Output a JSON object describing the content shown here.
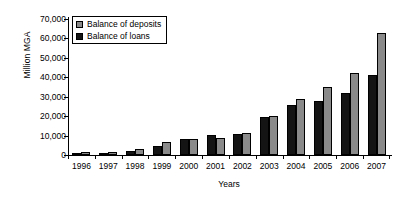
{
  "chart_data": {
    "type": "bar",
    "title": "",
    "xlabel": "Years",
    "ylabel": "Million MGA",
    "categories": [
      "1996",
      "1997",
      "1998",
      "1999",
      "2000",
      "2001",
      "2002",
      "2003",
      "2004",
      "2005",
      "2006",
      "2007"
    ],
    "series": [
      {
        "name": "Balance of loans",
        "color": "#141414",
        "values": [
          1000,
          1200,
          2000,
          4500,
          8000,
          10500,
          11000,
          19500,
          26000,
          28000,
          32000,
          41000
        ]
      },
      {
        "name": "Balance of deposits",
        "color": "#8a8a8a",
        "values": [
          1500,
          1500,
          3000,
          6500,
          8500,
          9000,
          11500,
          20000,
          29000,
          35000,
          42000,
          63000
        ]
      }
    ],
    "ylim": [
      0,
      70000
    ],
    "ytick_labels": [
      "70,000",
      "60,000",
      "50,000",
      "40,000",
      "30,000",
      "20,000",
      "10,000",
      "0"
    ],
    "ytick_values": [
      70000,
      60000,
      50000,
      40000,
      30000,
      20000,
      10000,
      0
    ],
    "grid": false,
    "legend_position": "top-left"
  },
  "legend": {
    "items": [
      {
        "label": "Balance of deposits",
        "swatch": "deposits-swatch"
      },
      {
        "label": "Balance of loans",
        "swatch": "loans-swatch"
      }
    ]
  }
}
